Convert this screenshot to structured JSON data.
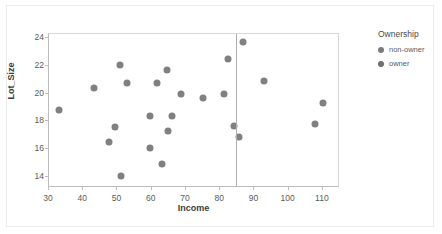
{
  "chart_data": {
    "type": "scatter",
    "title": "",
    "xlabel": "Income",
    "ylabel": "Lot_Size",
    "xlim": [
      30,
      115
    ],
    "ylim": [
      13.2,
      24.3
    ],
    "xticks": [
      30,
      40,
      50,
      60,
      70,
      80,
      90,
      100,
      110
    ],
    "yticks": [
      14,
      16,
      18,
      20,
      22,
      24
    ],
    "grid": false,
    "legend": {
      "title": "Ownership",
      "position": "right",
      "entries": [
        {
          "label": "non-owner",
          "color": "#7b7b7b"
        },
        {
          "label": "owner",
          "color": "#6e6e6e"
        }
      ]
    },
    "annotations": [
      {
        "kind": "vline",
        "x": 84.5,
        "color": "#b0b0b0"
      }
    ],
    "marker": {
      "size": 7,
      "color": "#808080"
    },
    "series": [
      {
        "name": "points",
        "color": "#808080",
        "points": [
          {
            "x": 32.8,
            "y": 18.8
          },
          {
            "x": 43.2,
            "y": 20.4
          },
          {
            "x": 47.4,
            "y": 16.5
          },
          {
            "x": 49.2,
            "y": 17.6
          },
          {
            "x": 50.8,
            "y": 22.1
          },
          {
            "x": 51.0,
            "y": 14.1
          },
          {
            "x": 52.8,
            "y": 20.8
          },
          {
            "x": 59.4,
            "y": 16.1
          },
          {
            "x": 59.6,
            "y": 18.4
          },
          {
            "x": 61.5,
            "y": 20.8
          },
          {
            "x": 63.0,
            "y": 14.9
          },
          {
            "x": 64.4,
            "y": 21.7
          },
          {
            "x": 64.8,
            "y": 17.3
          },
          {
            "x": 65.8,
            "y": 18.4
          },
          {
            "x": 68.6,
            "y": 20.0
          },
          {
            "x": 75.0,
            "y": 19.7
          },
          {
            "x": 81.0,
            "y": 20.0
          },
          {
            "x": 82.4,
            "y": 22.5
          },
          {
            "x": 84.0,
            "y": 17.7
          },
          {
            "x": 85.4,
            "y": 16.9
          },
          {
            "x": 86.6,
            "y": 23.7
          },
          {
            "x": 92.8,
            "y": 20.9
          },
          {
            "x": 107.8,
            "y": 17.8
          },
          {
            "x": 110.0,
            "y": 19.3
          }
        ]
      }
    ]
  }
}
